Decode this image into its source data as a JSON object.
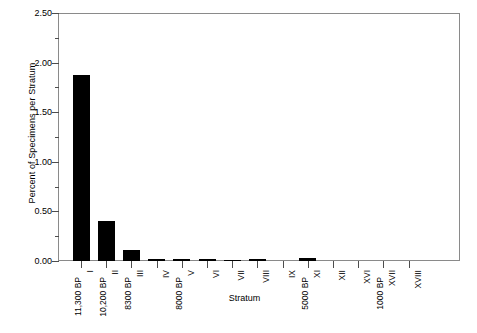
{
  "chart_data": {
    "type": "bar",
    "title": "",
    "xlabel": "Stratum",
    "ylabel": "Percent of Specimens per Stratum",
    "ylim": [
      0.0,
      2.5
    ],
    "ytick_labels": [
      "0.00",
      "0.50",
      "1.00",
      "1.50",
      "2.00",
      "2.50"
    ],
    "ytick_values": [
      0.0,
      0.5,
      1.0,
      1.5,
      2.0,
      2.5
    ],
    "minor_ticks": true,
    "grid": false,
    "legend": "none",
    "categories": [
      "I",
      "II",
      "III",
      "IV",
      "V",
      "VI",
      "VII",
      "VIII",
      "IX",
      "XI",
      "XII",
      "XVI",
      "XVII",
      "XVIII"
    ],
    "values": [
      1.87,
      0.4,
      0.11,
      0.02,
      0.02,
      0.025,
      0.015,
      0.02,
      0.0,
      0.03,
      0.0,
      0.0,
      0.0,
      0.0
    ],
    "date_annotations": [
      {
        "category": "I",
        "label": "11,300 BP"
      },
      {
        "category": "II",
        "label": "10,200 BP"
      },
      {
        "category": "III",
        "label": "8300 BP"
      },
      {
        "category": "V",
        "label": "8000 BP"
      },
      {
        "category": "XI",
        "label": "5000 BP"
      },
      {
        "category": "XVII",
        "label": "1000 BP"
      }
    ],
    "bar_color": "#000000",
    "axis_color": "#8a8a8a"
  }
}
